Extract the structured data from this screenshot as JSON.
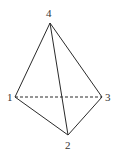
{
  "diagram": {
    "type": "tetrahedron",
    "stroke_color": "#2a2a2a",
    "vertices": [
      {
        "id": "1",
        "label": "1",
        "x": 15,
        "y": 97,
        "label_x": 7,
        "label_y": 101
      },
      {
        "id": "2",
        "label": "2",
        "x": 68,
        "y": 135,
        "label_x": 65,
        "label_y": 149
      },
      {
        "id": "3",
        "label": "3",
        "x": 102,
        "y": 97,
        "label_x": 105,
        "label_y": 101
      },
      {
        "id": "4",
        "label": "4",
        "x": 50,
        "y": 23,
        "label_x": 46,
        "label_y": 17
      }
    ],
    "edges": [
      {
        "from": "4",
        "to": "1",
        "style": "solid"
      },
      {
        "from": "4",
        "to": "3",
        "style": "solid"
      },
      {
        "from": "4",
        "to": "2",
        "style": "solid"
      },
      {
        "from": "1",
        "to": "2",
        "style": "solid"
      },
      {
        "from": "3",
        "to": "2",
        "style": "solid"
      },
      {
        "from": "1",
        "to": "3",
        "style": "dashed"
      }
    ]
  }
}
